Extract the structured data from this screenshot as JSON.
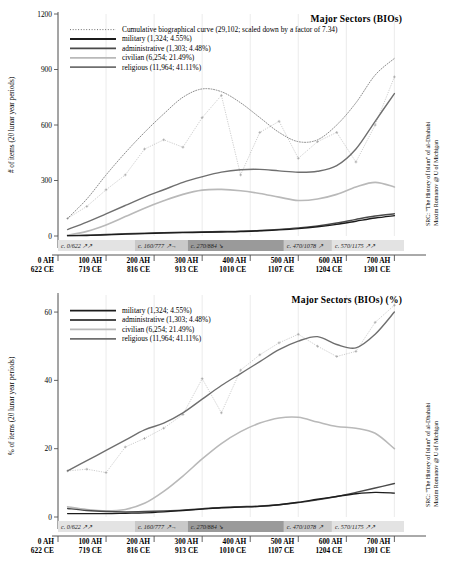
{
  "figure": {
    "source_line1": "SRC: \"The History of Islam\" of al-Dhahabi",
    "source_line2": "Maxim Romanov @ U of Michigan"
  },
  "colors": {
    "military": "#1c1c1c",
    "administrative": "#4a4a4a",
    "civilian": "#b9b9b9",
    "religious": "#6f6f6f",
    "cumulative": "#707070",
    "grid": "#dedede",
    "band_light": "#e3e3e3",
    "band_mid": "#c9c9c9",
    "band_dark": "#9a9a9a"
  },
  "xaxis": {
    "ah": [
      "0 AH",
      "100 AH",
      "200 AH",
      "300 AH",
      "400 AH",
      "500 AH",
      "600 AH",
      "700 AH"
    ],
    "ce": [
      "622 CE",
      "719 CE",
      "816 CE",
      "913 CE",
      "1010 CE",
      "1107 CE",
      "1204 CE",
      "1301 CE"
    ],
    "values": [
      0,
      100,
      200,
      300,
      400,
      500,
      600,
      700
    ]
  },
  "bands": [
    {
      "label": "c. 0/622 ↗↗",
      "start": 0,
      "end": 160,
      "shade": "band_light"
    },
    {
      "label": "c. 160/777 ↗→",
      "start": 160,
      "end": 270,
      "shade": "band_mid"
    },
    {
      "label": "c. 270/884 ↘",
      "start": 270,
      "end": 470,
      "shade": "band_dark"
    },
    {
      "label": "c. 470/1078 ↗",
      "start": 470,
      "end": 570,
      "shade": "band_mid"
    },
    {
      "label": "c. 570/1175 ↗↗",
      "start": 570,
      "end": 720,
      "shade": "band_light"
    }
  ],
  "chart_data": [
    {
      "id": "top",
      "type": "line",
      "title": "Major Sectors (BIOs)",
      "xlabel": "",
      "ylabel": "# of items (20 lunar year periods)",
      "ylim": [
        0,
        1200
      ],
      "yticks": [
        0,
        300,
        600,
        900,
        1200
      ],
      "xlim": [
        0,
        720
      ],
      "grid": true,
      "legend_position": "top-left",
      "legend": [
        {
          "name": "Cumulative biographical curve (29,102; scaled down by a factor of 7.34)",
          "style": "dotted",
          "color": "cumulative"
        },
        {
          "name": "military (1,324; 4.55%)",
          "style": "solid",
          "color": "military"
        },
        {
          "name": "administrative (1,303; 4.48%)",
          "style": "solid",
          "color": "administrative"
        },
        {
          "name": "civilian (6,254; 21.49%)",
          "style": "solid",
          "color": "civilian"
        },
        {
          "name": "religious (11,964; 41.11%)",
          "style": "solid",
          "color": "religious"
        }
      ],
      "x": [
        20,
        60,
        100,
        140,
        180,
        220,
        260,
        300,
        340,
        380,
        420,
        460,
        500,
        540,
        580,
        620,
        660,
        700
      ],
      "series": [
        {
          "name": "cumulative",
          "smooth": true,
          "values": [
            95,
            200,
            330,
            450,
            560,
            660,
            750,
            795,
            780,
            720,
            640,
            560,
            510,
            520,
            600,
            720,
            870,
            960
          ]
        },
        {
          "name": "religious",
          "smooth": true,
          "values": [
            35,
            75,
            120,
            165,
            210,
            250,
            290,
            320,
            345,
            358,
            360,
            352,
            345,
            350,
            380,
            470,
            620,
            770
          ]
        },
        {
          "name": "civilian",
          "smooth": true,
          "values": [
            5,
            25,
            60,
            105,
            150,
            190,
            225,
            248,
            252,
            245,
            230,
            210,
            192,
            200,
            225,
            265,
            290,
            265
          ]
        },
        {
          "name": "administrative",
          "smooth": true,
          "values": [
            2,
            4,
            8,
            12,
            15,
            18,
            20,
            22,
            24,
            26,
            30,
            36,
            44,
            55,
            70,
            90,
            108,
            120
          ]
        },
        {
          "name": "military",
          "smooth": true,
          "values": [
            2,
            3,
            6,
            10,
            13,
            16,
            18,
            20,
            22,
            24,
            28,
            33,
            40,
            50,
            63,
            80,
            97,
            110
          ]
        }
      ],
      "scatter": [
        {
          "name": "cumulative_raw",
          "values": [
            95,
            160,
            250,
            330,
            470,
            520,
            480,
            640,
            760,
            330,
            560,
            620,
            420,
            510,
            560,
            400,
            600,
            860
          ]
        }
      ]
    },
    {
      "id": "bottom",
      "type": "line",
      "title": "Major Sectors (BIOs) (%)",
      "xlabel": "",
      "ylabel": "% of items (20 lunar year periods)",
      "ylim": [
        0,
        65
      ],
      "yticks": [
        0,
        20,
        40,
        60
      ],
      "xlim": [
        0,
        720
      ],
      "grid": true,
      "legend_position": "top-left",
      "legend": [
        {
          "name": "military (1,324; 4.55%)",
          "style": "solid",
          "color": "military"
        },
        {
          "name": "administrative (1,303; 4.48%)",
          "style": "solid",
          "color": "administrative"
        },
        {
          "name": "civilian (6,254; 21.49%)",
          "style": "solid",
          "color": "civilian"
        },
        {
          "name": "religious (11,964; 41.11%)",
          "style": "solid",
          "color": "religious"
        }
      ],
      "x": [
        20,
        60,
        100,
        140,
        180,
        220,
        260,
        300,
        340,
        380,
        420,
        460,
        500,
        540,
        580,
        620,
        660,
        700
      ],
      "series": [
        {
          "name": "religious",
          "smooth": true,
          "values": [
            13.5,
            16.5,
            19.5,
            22.5,
            25.5,
            27.5,
            30.5,
            34.5,
            38.5,
            42.0,
            45.5,
            49.0,
            51.5,
            52.8,
            50.5,
            49.5,
            53.5,
            60.0
          ]
        },
        {
          "name": "civilian",
          "smooth": true,
          "values": [
            3.0,
            2.2,
            1.8,
            2.2,
            4.0,
            7.5,
            12.0,
            17.0,
            21.5,
            25.0,
            27.5,
            29.0,
            29.2,
            27.8,
            26.5,
            26.0,
            24.5,
            20.0
          ]
        },
        {
          "name": "administrative",
          "smooth": true,
          "values": [
            2.5,
            1.9,
            1.6,
            1.5,
            1.6,
            1.8,
            2.0,
            2.4,
            2.8,
            3.0,
            3.2,
            3.6,
            4.2,
            5.0,
            6.0,
            7.2,
            8.5,
            9.8
          ]
        },
        {
          "name": "military",
          "smooth": true,
          "values": [
            1.0,
            1.0,
            1.0,
            1.1,
            1.2,
            1.5,
            1.9,
            2.3,
            2.7,
            2.9,
            3.1,
            3.6,
            4.3,
            5.2,
            6.0,
            6.8,
            7.2,
            7.0
          ]
        }
      ],
      "scatter": [
        {
          "name": "religious_raw",
          "values": [
            13.5,
            14.0,
            13.0,
            20.5,
            23.0,
            26.0,
            30.0,
            40.5,
            30.5,
            43.0,
            47.5,
            51.0,
            53.5,
            50.0,
            47.0,
            48.5,
            57.0,
            62.0
          ]
        }
      ]
    }
  ]
}
